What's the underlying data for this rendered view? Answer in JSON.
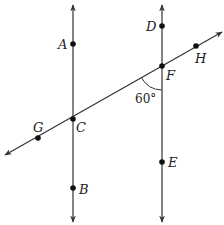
{
  "diagram": {
    "type": "geometry-parallel-lines-transversal",
    "colors": {
      "line": "#333333",
      "point": "#111111",
      "label": "#222222"
    },
    "lines": [
      {
        "name": "left-vertical-line",
        "x1": 73,
        "y1": 222,
        "x2": 73,
        "y2": 5
      },
      {
        "name": "right-vertical-line",
        "x1": 162,
        "y1": 222,
        "x2": 162,
        "y2": 5
      },
      {
        "name": "transversal-line",
        "x1": 5,
        "y1": 155,
        "x2": 222,
        "y2": 32
      }
    ],
    "points": [
      {
        "id": "A",
        "label": "A",
        "cx": 73,
        "cy": 44,
        "lx": 58,
        "ly": 49
      },
      {
        "id": "C",
        "label": "C",
        "cx": 73,
        "cy": 119,
        "lx": 76,
        "ly": 132
      },
      {
        "id": "B",
        "label": "B",
        "cx": 73,
        "cy": 188,
        "lx": 79,
        "ly": 194
      },
      {
        "id": "D",
        "label": "D",
        "cx": 162,
        "cy": 26,
        "lx": 146,
        "ly": 31
      },
      {
        "id": "F",
        "label": "F",
        "cx": 162,
        "cy": 66,
        "lx": 166,
        "ly": 80
      },
      {
        "id": "E",
        "label": "E",
        "cx": 162,
        "cy": 162,
        "lx": 168,
        "ly": 167
      },
      {
        "id": "H",
        "label": "H",
        "cx": 196,
        "cy": 46,
        "lx": 195,
        "ly": 63
      },
      {
        "id": "G",
        "label": "G",
        "cx": 38,
        "cy": 138,
        "lx": 33,
        "ly": 132
      }
    ],
    "angle": {
      "label": "60°",
      "vertex": "F",
      "x": 135,
      "y": 103
    }
  }
}
